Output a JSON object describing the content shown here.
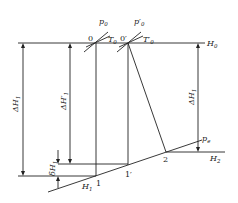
{
  "diagram": {
    "type": "thermodynamic process diagram (enthalpy drop)",
    "colors": {
      "line": "#222222",
      "background": "#ffffff"
    },
    "labels": {
      "p0": "p",
      "p0_sub": "0",
      "p0_prime": "p′",
      "p0_prime_sub": "0",
      "T0": "T",
      "T0_sub": "0",
      "T0_prime": "T′",
      "T0_prime_sub": "0",
      "point0": "0",
      "point0_prime": "0′",
      "H0": "H",
      "H0_sub": "0",
      "dH1": "ΔH",
      "dH1_sub": "1",
      "dH1_prime": "ΔH′",
      "dH1_prime_sub": "1",
      "dH1_right": "ΔH",
      "dH1_right_sub": "1",
      "deltaH1": "δH",
      "deltaH1_sub": "1",
      "H1": "H",
      "H1_sub": "1",
      "point1": "1",
      "point1_prime": "1′",
      "point2": "2",
      "pe": "p",
      "pe_sub": "e",
      "H2": "H",
      "H2_sub": "2"
    }
  }
}
